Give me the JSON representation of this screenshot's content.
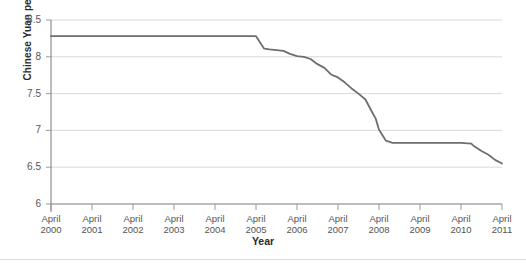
{
  "chart_data": {
    "type": "line",
    "title": "",
    "xlabel": "Year",
    "ylabel": "Chinese Yuan per Dollar",
    "ylim": [
      6,
      8.5
    ],
    "yticks": [
      6,
      6.5,
      7,
      7.5,
      8,
      8.5
    ],
    "ytick_labels": [
      "6",
      "6.5",
      "7",
      "7.5",
      "8",
      "8.5"
    ],
    "xlim": [
      2000.25,
      2011.25
    ],
    "xticks": [
      2000.25,
      2001.25,
      2002.25,
      2003.25,
      2004.25,
      2005.25,
      2006.25,
      2007.25,
      2008.25,
      2009.25,
      2010.25,
      2011.25
    ],
    "xtick_labels": [
      {
        "line1": "April",
        "line2": "2000"
      },
      {
        "line1": "April",
        "line2": "2001"
      },
      {
        "line1": "April",
        "line2": "2002"
      },
      {
        "line1": "April",
        "line2": "2003"
      },
      {
        "line1": "April",
        "line2": "2004"
      },
      {
        "line1": "April",
        "line2": "2005"
      },
      {
        "line1": "April",
        "line2": "2006"
      },
      {
        "line1": "April",
        "line2": "2007"
      },
      {
        "line1": "April",
        "line2": "2008"
      },
      {
        "line1": "April",
        "line2": "2009"
      },
      {
        "line1": "April",
        "line2": "2010"
      },
      {
        "line1": "April",
        "line2": "2011"
      }
    ],
    "grid": true,
    "grid_axis": "y",
    "legend": false,
    "line_color": "#6e6e6e",
    "grid_color": "#d9d9d9",
    "axis_color": "#9a9a9a",
    "series": [
      {
        "name": "Chinese Yuan per US Dollar",
        "x": [
          2000.25,
          2001.25,
          2002.25,
          2003.25,
          2004.25,
          2005.25,
          2005.45,
          2005.58,
          2005.75,
          2005.92,
          2006.08,
          2006.25,
          2006.42,
          2006.58,
          2006.75,
          2006.92,
          2007.08,
          2007.25,
          2007.42,
          2007.58,
          2007.75,
          2007.92,
          2008.08,
          2008.17,
          2008.25,
          2008.42,
          2008.58,
          2008.75,
          2008.92,
          2009.25,
          2009.58,
          2009.92,
          2010.25,
          2010.5,
          2010.58,
          2010.75,
          2010.92,
          2011.08,
          2011.25
        ],
        "values": [
          8.28,
          8.28,
          8.28,
          8.28,
          8.28,
          8.28,
          8.11,
          8.1,
          8.09,
          8.08,
          8.04,
          8.01,
          8.0,
          7.97,
          7.9,
          7.85,
          7.76,
          7.72,
          7.65,
          7.57,
          7.5,
          7.42,
          7.25,
          7.16,
          7.01,
          6.86,
          6.83,
          6.83,
          6.83,
          6.83,
          6.83,
          6.83,
          6.83,
          6.82,
          6.78,
          6.72,
          6.67,
          6.6,
          6.55
        ]
      }
    ]
  }
}
